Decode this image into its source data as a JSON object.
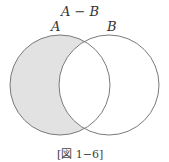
{
  "diagram": {
    "title": "A − B",
    "sets": [
      {
        "name": "A",
        "cx": 60,
        "cy": 85,
        "r": 50
      },
      {
        "name": "B",
        "cx": 109,
        "cy": 85,
        "r": 50
      }
    ],
    "shaded_region": "A minus B",
    "caption": "[図 1−6]",
    "colors": {
      "fill": "#e2e2e2",
      "stroke": "#7a7a7a"
    }
  }
}
